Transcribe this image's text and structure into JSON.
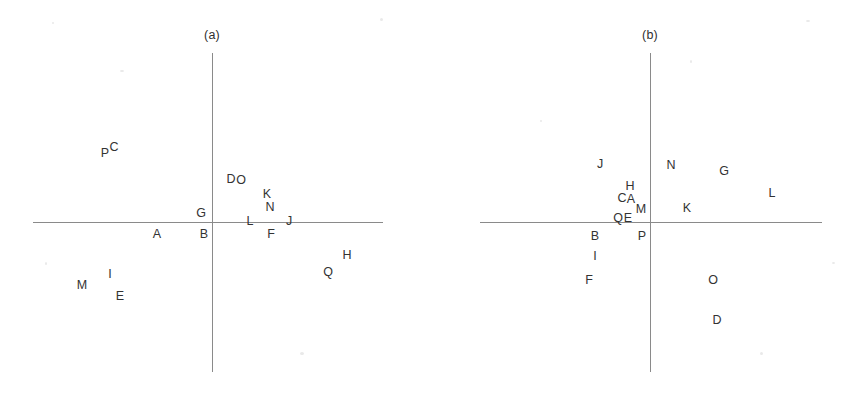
{
  "figure": {
    "width": 847,
    "height": 394,
    "background_color": "#ffffff",
    "axis_color": "#8a8a8a",
    "label_color": "#333333"
  },
  "chart_data": {
    "type": "scatter",
    "title": "",
    "xlabel": "",
    "ylabel": "",
    "grid": false,
    "legend": "none",
    "note": "Two biplot-style scatter panels; each data point is rendered only as its text label letter at its coordinate. Coordinates below are in screenshot pixel space.",
    "panels": [
      {
        "id": "a",
        "caption": "(a)",
        "caption_pos": {
          "x": 212,
          "y": 35
        },
        "axes": {
          "origin": {
            "x": 212,
            "y": 222
          },
          "x_axis": {
            "x1": 33,
            "x2": 383,
            "y": 222
          },
          "y_axis": {
            "x": 212,
            "y1": 53,
            "y2": 372
          }
        },
        "points": [
          {
            "label": "P",
            "x": 105,
            "y": 153
          },
          {
            "label": "C",
            "x": 114,
            "y": 147
          },
          {
            "label": "D",
            "x": 231,
            "y": 179
          },
          {
            "label": "O",
            "x": 241,
            "y": 180
          },
          {
            "label": "K",
            "x": 267,
            "y": 194
          },
          {
            "label": "N",
            "x": 270,
            "y": 207
          },
          {
            "label": "G",
            "x": 201,
            "y": 213
          },
          {
            "label": "L",
            "x": 250,
            "y": 221
          },
          {
            "label": "J",
            "x": 289,
            "y": 221
          },
          {
            "label": "A",
            "x": 157,
            "y": 234
          },
          {
            "label": "B",
            "x": 204,
            "y": 234
          },
          {
            "label": "F",
            "x": 271,
            "y": 234
          },
          {
            "label": "H",
            "x": 347,
            "y": 255
          },
          {
            "label": "Q",
            "x": 328,
            "y": 272
          },
          {
            "label": "I",
            "x": 110,
            "y": 274
          },
          {
            "label": "M",
            "x": 82,
            "y": 285
          },
          {
            "label": "E",
            "x": 120,
            "y": 296
          }
        ]
      },
      {
        "id": "b",
        "caption": "(b)",
        "caption_pos": {
          "x": 650,
          "y": 35
        },
        "axes": {
          "origin": {
            "x": 650,
            "y": 222
          },
          "x_axis": {
            "x1": 480,
            "x2": 822,
            "y": 222
          },
          "y_axis": {
            "x": 650,
            "y1": 53,
            "y2": 372
          }
        },
        "points": [
          {
            "label": "J",
            "x": 600,
            "y": 164
          },
          {
            "label": "N",
            "x": 671,
            "y": 165
          },
          {
            "label": "G",
            "x": 724,
            "y": 171
          },
          {
            "label": "L",
            "x": 772,
            "y": 193
          },
          {
            "label": "H",
            "x": 630,
            "y": 186
          },
          {
            "label": "C",
            "x": 622,
            "y": 198
          },
          {
            "label": "A",
            "x": 631,
            "y": 199
          },
          {
            "label": "M",
            "x": 641,
            "y": 209
          },
          {
            "label": "K",
            "x": 687,
            "y": 208
          },
          {
            "label": "Q",
            "x": 618,
            "y": 218
          },
          {
            "label": "E",
            "x": 628,
            "y": 218
          },
          {
            "label": "P",
            "x": 642,
            "y": 236
          },
          {
            "label": "B",
            "x": 595,
            "y": 236
          },
          {
            "label": "I",
            "x": 595,
            "y": 256
          },
          {
            "label": "F",
            "x": 589,
            "y": 280
          },
          {
            "label": "O",
            "x": 713,
            "y": 280
          },
          {
            "label": "D",
            "x": 717,
            "y": 320
          }
        ]
      }
    ]
  }
}
